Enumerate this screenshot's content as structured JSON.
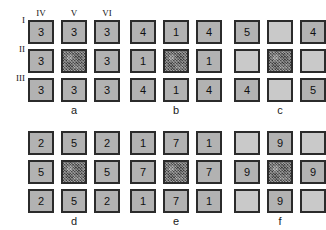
{
  "figure": {
    "width": 325,
    "height": 230,
    "background": "#ffffff",
    "border_color": "#2b2b2b",
    "cell_fill": "#b2b2b2",
    "blank_fill": "#c9c9c9",
    "noise_fill": "#6e6e6e"
  },
  "axis": {
    "column_headers": [
      "IV",
      "V",
      "VI"
    ],
    "row_headers": [
      "I",
      "II",
      "III"
    ]
  },
  "panels": [
    {
      "id": "a",
      "caption": "a",
      "has_axis_labels": true,
      "cells": [
        [
          {
            "text": "3",
            "kind": "digit"
          },
          {
            "text": "3",
            "kind": "digit"
          },
          {
            "text": "3",
            "kind": "digit"
          }
        ],
        [
          {
            "text": "3",
            "kind": "digit"
          },
          {
            "text": "",
            "kind": "noise"
          },
          {
            "text": "3",
            "kind": "digit"
          }
        ],
        [
          {
            "text": "3",
            "kind": "digit"
          },
          {
            "text": "3",
            "kind": "digit"
          },
          {
            "text": "3",
            "kind": "digit"
          }
        ]
      ]
    },
    {
      "id": "b",
      "caption": "b",
      "has_axis_labels": false,
      "cells": [
        [
          {
            "text": "4",
            "kind": "digit"
          },
          {
            "text": "1",
            "kind": "digit"
          },
          {
            "text": "4",
            "kind": "digit"
          }
        ],
        [
          {
            "text": "1",
            "kind": "digit"
          },
          {
            "text": "",
            "kind": "noise"
          },
          {
            "text": "1",
            "kind": "digit"
          }
        ],
        [
          {
            "text": "4",
            "kind": "digit"
          },
          {
            "text": "1",
            "kind": "digit"
          },
          {
            "text": "4",
            "kind": "digit"
          }
        ]
      ]
    },
    {
      "id": "c",
      "caption": "c",
      "has_axis_labels": false,
      "cells": [
        [
          {
            "text": "5",
            "kind": "digit"
          },
          {
            "text": "",
            "kind": "blank"
          },
          {
            "text": "4",
            "kind": "digit"
          }
        ],
        [
          {
            "text": "",
            "kind": "blank"
          },
          {
            "text": "",
            "kind": "noise"
          },
          {
            "text": "",
            "kind": "blank"
          }
        ],
        [
          {
            "text": "4",
            "kind": "digit"
          },
          {
            "text": "",
            "kind": "blank"
          },
          {
            "text": "5",
            "kind": "digit"
          }
        ]
      ]
    },
    {
      "id": "d",
      "caption": "d",
      "has_axis_labels": false,
      "cells": [
        [
          {
            "text": "2",
            "kind": "digit"
          },
          {
            "text": "5",
            "kind": "digit"
          },
          {
            "text": "2",
            "kind": "digit"
          }
        ],
        [
          {
            "text": "5",
            "kind": "digit"
          },
          {
            "text": "",
            "kind": "noise"
          },
          {
            "text": "5",
            "kind": "digit"
          }
        ],
        [
          {
            "text": "2",
            "kind": "digit"
          },
          {
            "text": "5",
            "kind": "digit"
          },
          {
            "text": "2",
            "kind": "digit"
          }
        ]
      ]
    },
    {
      "id": "e",
      "caption": "e",
      "has_axis_labels": false,
      "cells": [
        [
          {
            "text": "1",
            "kind": "digit"
          },
          {
            "text": "7",
            "kind": "digit"
          },
          {
            "text": "1",
            "kind": "digit"
          }
        ],
        [
          {
            "text": "7",
            "kind": "digit"
          },
          {
            "text": "",
            "kind": "noise"
          },
          {
            "text": "7",
            "kind": "digit"
          }
        ],
        [
          {
            "text": "1",
            "kind": "digit"
          },
          {
            "text": "7",
            "kind": "digit"
          },
          {
            "text": "1",
            "kind": "digit"
          }
        ]
      ]
    },
    {
      "id": "f",
      "caption": "f",
      "has_axis_labels": false,
      "cells": [
        [
          {
            "text": "",
            "kind": "blank"
          },
          {
            "text": "9",
            "kind": "digit"
          },
          {
            "text": "",
            "kind": "blank"
          }
        ],
        [
          {
            "text": "9",
            "kind": "digit"
          },
          {
            "text": "",
            "kind": "noise"
          },
          {
            "text": "9",
            "kind": "digit"
          }
        ],
        [
          {
            "text": "",
            "kind": "blank"
          },
          {
            "text": "9",
            "kind": "digit"
          },
          {
            "text": "",
            "kind": "blank"
          }
        ]
      ]
    }
  ]
}
